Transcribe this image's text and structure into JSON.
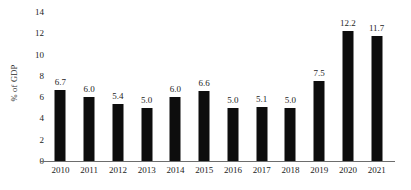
{
  "chart_data": {
    "type": "bar",
    "title": "",
    "subtitle": "",
    "xlabel": "",
    "ylabel": "% of GDP",
    "categories": [
      "2010",
      "2011",
      "2012",
      "2013",
      "2014",
      "2015",
      "2016",
      "2017",
      "2018",
      "2019",
      "2020",
      "2021"
    ],
    "values": [
      6.7,
      6.0,
      5.4,
      5.0,
      6.0,
      6.6,
      5.0,
      5.1,
      5.0,
      7.5,
      12.2,
      11.7
    ],
    "value_labels": [
      "6.7",
      "6.0",
      "5.4",
      "5.0",
      "6.0",
      "6.6",
      "5.0",
      "5.1",
      "5.0",
      "7.5",
      "12.2",
      "11.7"
    ],
    "ylim": [
      0,
      14
    ],
    "ytick_values": [
      0,
      2,
      4,
      6,
      8,
      10,
      12,
      14
    ],
    "ytick_labels": [
      "0",
      "2",
      "4",
      "6",
      "8",
      "10",
      "12",
      "14"
    ],
    "grid": false,
    "legend": null,
    "bar_color": "#0d0d0d",
    "axis_color": "#6d6d6d",
    "text_color": "#232323",
    "background": "#ffffff"
  }
}
